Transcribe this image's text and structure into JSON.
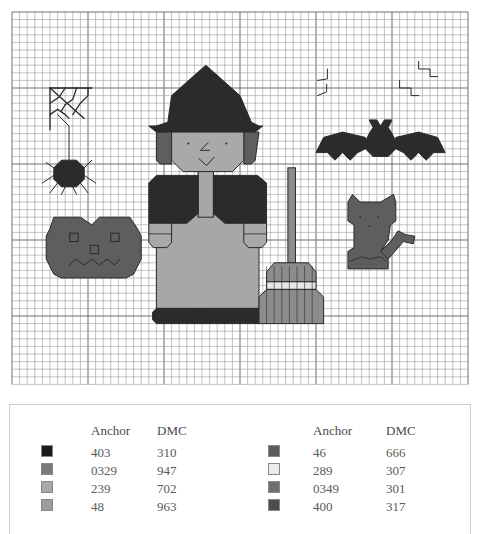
{
  "chart": {
    "motifs": [
      "spider-web",
      "spider",
      "witch",
      "broom",
      "bat",
      "bat-squiggles",
      "cat",
      "pumpkin"
    ],
    "colors": {
      "grid_line": "#9a9a9a",
      "grid_major": "#6e6e6e",
      "outline": "#2a2a2a",
      "black": "#2b2b2b",
      "dark_grey": "#5e5e5e",
      "mid_grey": "#8c8c8c",
      "light_grey": "#b3b3b3",
      "lightest": "#e6e6e6",
      "skin": "#a9a9a9",
      "dress": "#a7a7a7"
    }
  },
  "legend": {
    "columns": [
      {
        "headers": {
          "anchor": "Anchor",
          "dmc": "DMC"
        },
        "rows": [
          {
            "anchor": "403",
            "dmc": "310",
            "swatch": "#1c1c1c"
          },
          {
            "anchor": "0329",
            "dmc": "947",
            "swatch": "#7a7a7a"
          },
          {
            "anchor": "239",
            "dmc": "702",
            "swatch": "#a8a8a8"
          },
          {
            "anchor": "48",
            "dmc": "963",
            "swatch": "#9d9d9d"
          }
        ]
      },
      {
        "headers": {
          "anchor": "Anchor",
          "dmc": "DMC"
        },
        "rows": [
          {
            "anchor": "46",
            "dmc": "666",
            "swatch": "#5c5c5c"
          },
          {
            "anchor": "289",
            "dmc": "307",
            "swatch": "#ececec"
          },
          {
            "anchor": "0349",
            "dmc": "301",
            "swatch": "#6f6f6f"
          },
          {
            "anchor": "400",
            "dmc": "317",
            "swatch": "#4d4d4d"
          }
        ]
      }
    ]
  }
}
